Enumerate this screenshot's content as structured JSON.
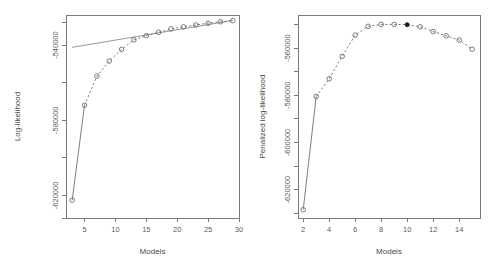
{
  "figure": {
    "panel_count": 2,
    "background": "#ffffff",
    "line_color": "#6f6f6f",
    "marker_color": "#6f6f6f",
    "highlight_color": "#1a1a1a",
    "axis_color": "#7a7a7a",
    "text_color": "#5b5b5b"
  },
  "chart_data": [
    {
      "type": "line",
      "panel": "left",
      "title": "",
      "xlabel": "Models",
      "ylabel": "Log-likelihood",
      "xlim": [
        2,
        30
      ],
      "ylim": [
        -632000,
        -524000
      ],
      "xticks": [
        5,
        10,
        15,
        20,
        25,
        30
      ],
      "xtick_labels": [
        "5",
        "10",
        "15",
        "20",
        "25",
        "30"
      ],
      "yticks": [
        -620000,
        -580000,
        -540000
      ],
      "ytick_labels": [
        "-620000",
        "-580000",
        "-540000"
      ],
      "grid": false,
      "legend": "none",
      "marker": "open-circle",
      "linestyle": "dashed",
      "x": [
        3,
        5,
        7,
        9,
        11,
        13,
        15,
        17,
        19,
        21,
        23,
        25,
        27,
        29
      ],
      "values": [
        -622500,
        -572000,
        -556500,
        -548500,
        -542300,
        -537200,
        -535000,
        -533200,
        -531400,
        -530300,
        -529300,
        -528400,
        -527600,
        -527000
      ],
      "series": [
        {
          "name": "log-likelihood",
          "linestyle": "dashed",
          "marker": "open-circle",
          "values": [
            -622500,
            -572000,
            -556500,
            -548500,
            -542300,
            -537200,
            -535000,
            -533200,
            -531400,
            -530300,
            -529300,
            -528400,
            -527600,
            -527000
          ]
        },
        {
          "name": "reference-line",
          "linestyle": "solid",
          "marker": "none",
          "x": [
            3,
            29
          ],
          "values": [
            -541200,
            -526900
          ]
        }
      ]
    },
    {
      "type": "line",
      "panel": "right",
      "title": "",
      "xlabel": "Models",
      "ylabel": "Penalized log-likelihood",
      "xlim": [
        1.6,
        15.6
      ],
      "ylim": [
        -632000,
        -546000
      ],
      "xticks": [
        2,
        4,
        6,
        8,
        10,
        12,
        14
      ],
      "xtick_labels": [
        "2",
        "4",
        "6",
        "8",
        "10",
        "12",
        "14"
      ],
      "yticks": [
        -620000,
        -600000,
        -580000,
        -560000
      ],
      "ytick_labels": [
        "-620000",
        "-600000",
        "-580000",
        "-560000"
      ],
      "grid": false,
      "legend": "none",
      "marker": "open-circle",
      "linestyle": "dashed",
      "highlight_x": 10,
      "highlight_label": "selected model",
      "x": [
        2,
        3,
        4,
        5,
        6,
        7,
        8,
        9,
        10,
        11,
        12,
        13,
        14,
        15
      ],
      "values": [
        -628500,
        -580500,
        -573000,
        -563500,
        -554500,
        -550800,
        -550000,
        -550000,
        -550100,
        -551000,
        -553000,
        -554800,
        -556600,
        -560500
      ],
      "series": [
        {
          "name": "penalized log-likelihood",
          "linestyle": "dashed",
          "marker": "open-circle",
          "values": [
            -628500,
            -580500,
            -573000,
            -563500,
            -554500,
            -550800,
            -550000,
            -550000,
            -550100,
            -551000,
            -553000,
            -554800,
            -556600,
            -560500
          ]
        }
      ]
    }
  ]
}
